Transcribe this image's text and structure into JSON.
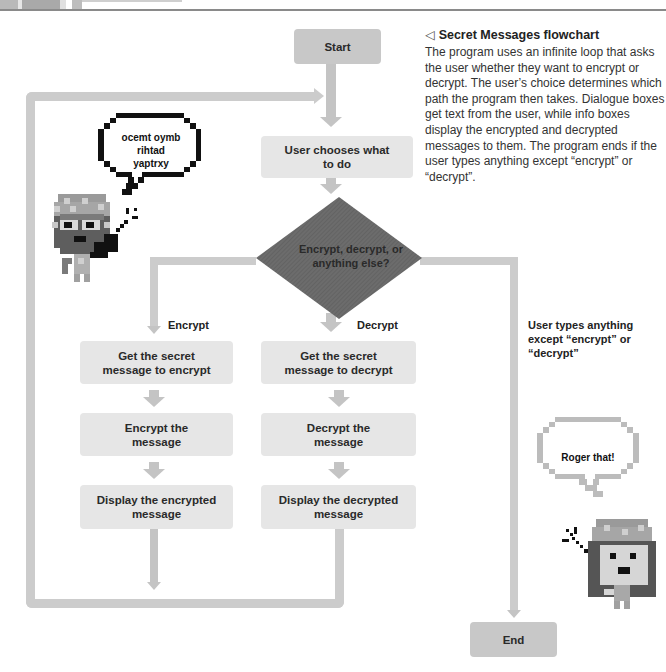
{
  "header": {
    "page_number": "",
    "title": ""
  },
  "caption": {
    "icon": "triangle-left-icon",
    "icon_glyph": "◁",
    "title": "Secret Messages flowchart",
    "body": "The program uses an infinite loop that asks the user whether they want to encrypt or decrypt. The user’s choice determines which path the program then takes. Dialogue boxes get text from the user, while info boxes display the encrypted and decrypted messages to them. The program ends if the user types anything except “encrypt” or “decrypt”."
  },
  "flowchart": {
    "start": "Start",
    "choose": "User chooses what to do",
    "decision": "Encrypt, decrypt, or anything else?",
    "branches": {
      "encrypt_label": "Encrypt",
      "decrypt_label": "Decrypt",
      "other_label": "User types anything except “encrypt” or “decrypt”"
    },
    "encrypt_steps": [
      "Get the secret message to encrypt",
      "Encrypt the message",
      "Display the encrypted message"
    ],
    "decrypt_steps": [
      "Get the secret message to decrypt",
      "Decrypt the message",
      "Display the decrypted message"
    ],
    "end": "End"
  },
  "characters": {
    "left_bubble": "ocemt oymb rihtad yaptrxy",
    "right_bubble": "Roger that!"
  },
  "colors": {
    "box": "#e6e6e6",
    "terminal_box": "#c8c8c8",
    "diamond": "#6a6a6a",
    "connector": "#cccccc"
  }
}
